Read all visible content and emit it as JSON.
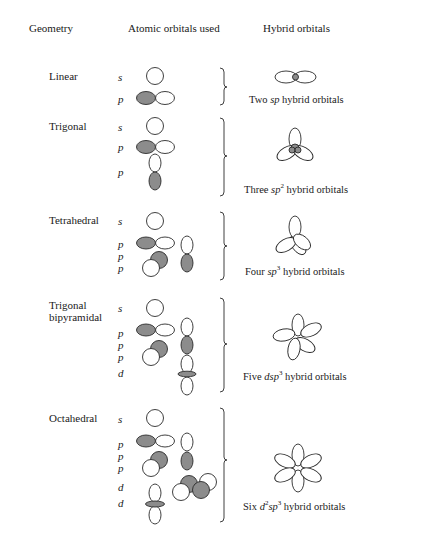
{
  "headers": {
    "geometry": "Geometry",
    "atomic": "Atomic orbitals used",
    "hybrid": "Hybrid orbitals"
  },
  "rows": [
    {
      "geometry": "Linear",
      "orbitals": [
        "s",
        "p"
      ],
      "hybrid_caption": {
        "pre": "Two ",
        "sym": "sp",
        "sup": "",
        "sym2": "",
        "sup2": "",
        "post": " hybrid orbitals"
      }
    },
    {
      "geometry": "Trigonal",
      "orbitals": [
        "s",
        "p",
        "p"
      ],
      "hybrid_caption": {
        "pre": "Three ",
        "sym": "sp",
        "sup": "2",
        "sym2": "",
        "sup2": "",
        "post": " hybrid orbitals"
      }
    },
    {
      "geometry": "Tetrahedral",
      "orbitals": [
        "s",
        "p",
        "p",
        "p"
      ],
      "hybrid_caption": {
        "pre": "Four ",
        "sym": "sp",
        "sup": "3",
        "sym2": "",
        "sup2": "",
        "post": " hybrid orbitals"
      }
    },
    {
      "geometry": "Trigonal",
      "geometry_line2": "bipyramidal",
      "orbitals": [
        "s",
        "p",
        "p",
        "p",
        "d"
      ],
      "hybrid_caption": {
        "pre": "Five ",
        "sym": "dsp",
        "sup": "3",
        "sym2": "",
        "sup2": "",
        "post": " hybrid orbitals"
      }
    },
    {
      "geometry": "Octahedral",
      "orbitals": [
        "s",
        "p",
        "p",
        "p",
        "d",
        "d"
      ],
      "hybrid_caption": {
        "pre": "Six ",
        "sym": "d",
        "sup": "2",
        "sym2": "sp",
        "sup2": "3",
        "post": " hybrid orbitals"
      }
    }
  ],
  "colors": {
    "shaded_lobe": "#8c8c8c",
    "outline": "#2a2a2a",
    "background": "#ffffff"
  }
}
